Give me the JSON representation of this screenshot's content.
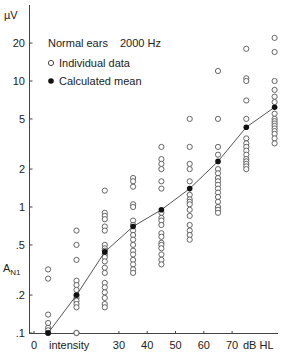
{
  "chart_data": {
    "type": "scatter",
    "title": "Normal ears    2000 Hz",
    "xlabel": "intensity",
    "x_unit": "dB HL",
    "ylabel": "A_N1",
    "y_unit": "µV",
    "y_scale": "log",
    "ylim": [
      0.1,
      30
    ],
    "xlim": [
      0,
      90
    ],
    "grid": false,
    "legend_position": "top-left",
    "x_ticks": [
      "0",
      "30",
      "40",
      "50",
      "60",
      "70"
    ],
    "y_ticks": [
      "20",
      "10",
      "5",
      "2",
      "1",
      ".5",
      ".2",
      ".1"
    ],
    "legend": [
      {
        "marker": "open-circle",
        "label": "Individual data"
      },
      {
        "marker": "filled-circle",
        "label": "Calculated mean"
      }
    ],
    "series": [
      {
        "name": "Calculated mean",
        "type": "line",
        "x": [
          5,
          15,
          25,
          35,
          45,
          55,
          65,
          75,
          85
        ],
        "values": [
          0.1,
          0.2,
          0.44,
          0.7,
          0.95,
          1.4,
          2.3,
          4.3,
          6.2
        ]
      },
      {
        "name": "Individual data",
        "type": "scatter",
        "points": [
          [
            5,
            0.32
          ],
          [
            5,
            0.27
          ],
          [
            5,
            0.14
          ],
          [
            5,
            0.12
          ],
          [
            5,
            0.11
          ],
          [
            5,
            0.105
          ],
          [
            5,
            0.1
          ],
          [
            5,
            0.1
          ],
          [
            5,
            0.1
          ],
          [
            15,
            0.65
          ],
          [
            15,
            0.5
          ],
          [
            15,
            0.38
          ],
          [
            15,
            0.26
          ],
          [
            15,
            0.24
          ],
          [
            15,
            0.22
          ],
          [
            15,
            0.2
          ],
          [
            15,
            0.19
          ],
          [
            15,
            0.18
          ],
          [
            15,
            0.17
          ],
          [
            15,
            0.16
          ],
          [
            15,
            0.1
          ],
          [
            15,
            0.1
          ],
          [
            25,
            1.35
          ],
          [
            25,
            0.9
          ],
          [
            25,
            0.85
          ],
          [
            25,
            0.8
          ],
          [
            25,
            0.7
          ],
          [
            25,
            0.65
          ],
          [
            25,
            0.5
          ],
          [
            25,
            0.47
          ],
          [
            25,
            0.45
          ],
          [
            25,
            0.42
          ],
          [
            25,
            0.4
          ],
          [
            25,
            0.37
          ],
          [
            25,
            0.33
          ],
          [
            25,
            0.3
          ],
          [
            25,
            0.25
          ],
          [
            25,
            0.23
          ],
          [
            25,
            0.21
          ],
          [
            25,
            0.19
          ],
          [
            25,
            0.17
          ],
          [
            25,
            0.16
          ],
          [
            35,
            1.7
          ],
          [
            35,
            1.6
          ],
          [
            35,
            1.45
          ],
          [
            35,
            1.05
          ],
          [
            35,
            1.0
          ],
          [
            35,
            0.78
          ],
          [
            35,
            0.72
          ],
          [
            35,
            0.65
          ],
          [
            35,
            0.6
          ],
          [
            35,
            0.55
          ],
          [
            35,
            0.5
          ],
          [
            35,
            0.45
          ],
          [
            35,
            0.42
          ],
          [
            35,
            0.38
          ],
          [
            35,
            0.35
          ],
          [
            35,
            0.32
          ],
          [
            35,
            0.3
          ],
          [
            45,
            3.0
          ],
          [
            45,
            2.4
          ],
          [
            45,
            2.2
          ],
          [
            45,
            2.0
          ],
          [
            45,
            1.6
          ],
          [
            45,
            1.4
          ],
          [
            45,
            0.9
          ],
          [
            45,
            0.82
          ],
          [
            45,
            0.78
          ],
          [
            45,
            0.72
          ],
          [
            45,
            0.62
          ],
          [
            45,
            0.58
          ],
          [
            45,
            0.52
          ],
          [
            45,
            0.5
          ],
          [
            45,
            0.47
          ],
          [
            45,
            0.42
          ],
          [
            45,
            0.38
          ],
          [
            45,
            0.35
          ],
          [
            55,
            5.0
          ],
          [
            55,
            3.0
          ],
          [
            55,
            2.2
          ],
          [
            55,
            2.0
          ],
          [
            55,
            1.6
          ],
          [
            55,
            1.25
          ],
          [
            55,
            1.15
          ],
          [
            55,
            1.1
          ],
          [
            55,
            1.05
          ],
          [
            55,
            0.95
          ],
          [
            55,
            0.85
          ],
          [
            55,
            0.72
          ],
          [
            55,
            0.65
          ],
          [
            55,
            0.6
          ],
          [
            55,
            0.55
          ],
          [
            65,
            12.0
          ],
          [
            65,
            5.0
          ],
          [
            65,
            3.0
          ],
          [
            65,
            2.6
          ],
          [
            65,
            2.0
          ],
          [
            65,
            1.85
          ],
          [
            65,
            1.7
          ],
          [
            65,
            1.6
          ],
          [
            65,
            1.5
          ],
          [
            65,
            1.4
          ],
          [
            65,
            1.3
          ],
          [
            65,
            1.2
          ],
          [
            65,
            1.1
          ],
          [
            65,
            1.0
          ],
          [
            65,
            0.95
          ],
          [
            65,
            0.9
          ],
          [
            75,
            18.0
          ],
          [
            75,
            10.5
          ],
          [
            75,
            10.0
          ],
          [
            75,
            7.0
          ],
          [
            75,
            5.0
          ],
          [
            75,
            3.5
          ],
          [
            75,
            3.2
          ],
          [
            75,
            3.0
          ],
          [
            75,
            2.8
          ],
          [
            75,
            2.6
          ],
          [
            75,
            2.4
          ],
          [
            75,
            2.3
          ],
          [
            75,
            2.2
          ],
          [
            75,
            2.1
          ],
          [
            75,
            2.0
          ],
          [
            85,
            22.0
          ],
          [
            85,
            17.0
          ],
          [
            85,
            10.0
          ],
          [
            85,
            8.5
          ],
          [
            85,
            7.5
          ],
          [
            85,
            6.8
          ],
          [
            85,
            5.5
          ],
          [
            85,
            5.0
          ],
          [
            85,
            4.8
          ],
          [
            85,
            4.6
          ],
          [
            85,
            4.4
          ],
          [
            85,
            4.2
          ],
          [
            85,
            4.0
          ],
          [
            85,
            3.8
          ],
          [
            85,
            3.5
          ],
          [
            85,
            3.2
          ]
        ]
      }
    ]
  },
  "labels": {
    "y_unit": "µV",
    "y_name_main": "A",
    "y_name_sub": "N1",
    "x_name": "intensity",
    "x_unit": "dB HL",
    "legend_title": "Normal ears",
    "legend_freq": "2000 Hz",
    "legend_individual": "Individual data",
    "legend_mean": "Calculated mean"
  }
}
